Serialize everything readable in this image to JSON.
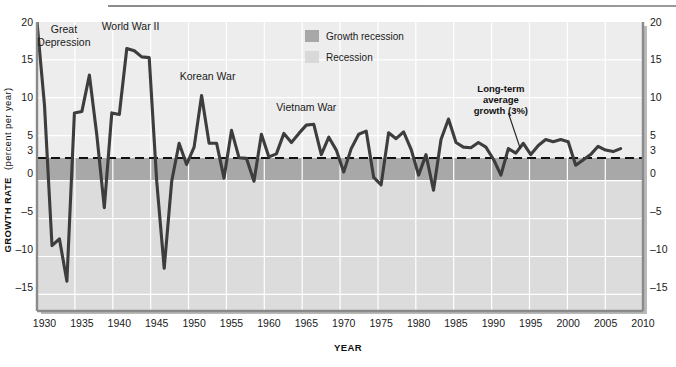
{
  "figure": {
    "name": "us-real-gdp-growth-rate-1929-2007",
    "axis_titles": {
      "y_main": "GROWTH RATE",
      "y_sub": "(percent per year)",
      "x": "YEAR"
    }
  },
  "legend": {
    "position": "top-center",
    "items": [
      {
        "label": "Growth recession",
        "color": "#a8a8a8",
        "swatch": "growth-recession-swatch"
      },
      {
        "label": "Recession",
        "color": "#d9d9d9",
        "swatch": "recession-swatch"
      }
    ]
  },
  "annotations": [
    {
      "id": "great-depression",
      "text": "Great\nDepression",
      "line1": "Great",
      "line2": "Depression",
      "x": 1932.6,
      "y": 18.6,
      "bold": false
    },
    {
      "id": "world-war-ii",
      "text": "World War II",
      "line1": "World War II",
      "line2": "",
      "x": 1941.5,
      "y": 18.9,
      "bold": false
    },
    {
      "id": "korean-war",
      "text": "Korean War",
      "line1": "Korean War",
      "line2": "",
      "x": 1951.8,
      "y": 12.4,
      "bold": false
    },
    {
      "id": "vietnam-war",
      "text": "Vietnam War",
      "line1": "Vietnam War",
      "line2": "",
      "x": 1965.0,
      "y": 8.3,
      "bold": false
    },
    {
      "id": "long-term-average-growth",
      "line1": "Long-term",
      "line2": "average",
      "line3": "growth (3%)",
      "x": 1991.0,
      "y": 10.8,
      "bold": true,
      "leader": {
        "from_x": 1992.0,
        "from_y": 8.0,
        "to_x": 1993.6,
        "to_y": 3.3
      }
    }
  ],
  "chart_data": {
    "type": "line",
    "title": "",
    "subtitle": "",
    "xlabel": "YEAR",
    "ylabel": "GROWTH RATE (percent per year)",
    "xlim": [
      1929,
      2010
    ],
    "ylim": [
      -18,
      20
    ],
    "grid": true,
    "grid_orientation": "both",
    "y_ticks": [
      20,
      15,
      10,
      5,
      3,
      0,
      -5,
      -10,
      -15
    ],
    "y_ticks_both_sides": true,
    "x_ticks": [
      1930,
      1935,
      1940,
      1945,
      1950,
      1955,
      1960,
      1965,
      1970,
      1975,
      1980,
      1985,
      1990,
      1995,
      2000,
      2005,
      2010
    ],
    "reference_line": {
      "label": "Long-term average growth (3%)",
      "value": 3,
      "style": "dashed",
      "color": "#111111"
    },
    "bands": [
      {
        "name": "Growth recession",
        "from": 0,
        "to": 3,
        "color": "#a8a8a8"
      },
      {
        "name": "Recession",
        "from": -18,
        "to": 0,
        "color": "#d9d9d9"
      }
    ],
    "plot_background": "#ebebeb",
    "series": [
      {
        "name": "Real GDP growth rate",
        "color": "#3d3d3d",
        "x": [
          1929,
          1930,
          1931,
          1932,
          1933,
          1934,
          1935,
          1936,
          1937,
          1938,
          1939,
          1940,
          1941,
          1942,
          1943,
          1944,
          1945,
          1946,
          1947,
          1948,
          1949,
          1950,
          1951,
          1952,
          1953,
          1954,
          1955,
          1956,
          1957,
          1958,
          1959,
          1960,
          1961,
          1962,
          1963,
          1964,
          1965,
          1966,
          1967,
          1968,
          1969,
          1970,
          1971,
          1972,
          1973,
          1974,
          1975,
          1976,
          1977,
          1978,
          1979,
          1980,
          1981,
          1982,
          1983,
          1984,
          1985,
          1986,
          1987,
          1988,
          1989,
          1990,
          1991,
          1992,
          1993,
          1994,
          1995,
          1996,
          1997,
          1998,
          1999,
          2000,
          2001,
          2002,
          2003,
          2004,
          2005,
          2006,
          2007
        ],
        "values": [
          20.0,
          9.0,
          -9.5,
          -8.6,
          -14.2,
          8.0,
          8.2,
          13.0,
          5.0,
          -4.5,
          8.0,
          7.8,
          16.5,
          16.2,
          15.4,
          15.3,
          -1.0,
          -12.5,
          -1.0,
          4.0,
          1.2,
          3.5,
          10.3,
          4.0,
          4.0,
          -0.6,
          5.7,
          2.1,
          2.0,
          -1.0,
          5.2,
          2.2,
          2.6,
          5.3,
          4.1,
          5.3,
          6.4,
          6.5,
          2.5,
          4.8,
          3.1,
          0.2,
          3.3,
          5.2,
          5.6,
          -0.5,
          -1.5,
          5.4,
          4.6,
          5.5,
          3.2,
          -0.2,
          2.5,
          -2.2,
          4.5,
          7.2,
          4.1,
          3.5,
          3.4,
          4.1,
          3.5,
          1.9,
          -0.2,
          3.3,
          2.7,
          4.0,
          2.5,
          3.7,
          4.5,
          4.2,
          4.5,
          4.2,
          1.1,
          1.8,
          2.5,
          3.6,
          3.1,
          2.9,
          3.3
        ]
      }
    ]
  }
}
